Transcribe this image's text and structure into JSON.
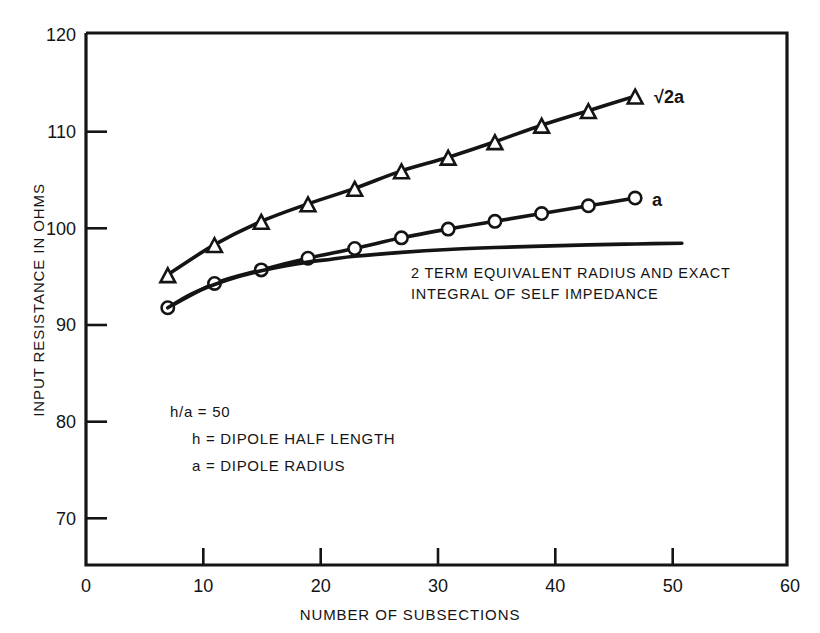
{
  "chart_data": {
    "type": "line",
    "title": "",
    "xlabel": "NUMBER OF SUBSECTIONS",
    "ylabel": "INPUT RESISTANCE IN OHMS",
    "xlim": [
      0,
      60
    ],
    "ylim": [
      65.2,
      120
    ],
    "grid": false,
    "legend_position": "inline-right-of-curve",
    "xticks": [
      0,
      10,
      20,
      30,
      40,
      50,
      60
    ],
    "xtick_labels": [
      "0",
      "10",
      "20",
      "30",
      "40",
      "50",
      "60"
    ],
    "yticks": [
      70,
      80,
      90,
      100,
      110,
      120
    ],
    "ytick_labels": [
      "70",
      "80",
      "90",
      "100",
      "110",
      "120"
    ],
    "series": [
      {
        "name": "sqrt2a",
        "label": "√2a",
        "marker": "triangle",
        "x": [
          7,
          11,
          15,
          19,
          23,
          27,
          31,
          35,
          39,
          43,
          47
        ],
        "values": [
          95.1,
          98.2,
          100.6,
          102.4,
          104.0,
          105.8,
          107.2,
          108.8,
          110.5,
          112.0,
          113.5
        ]
      },
      {
        "name": "a",
        "label": "a",
        "marker": "circle",
        "x": [
          7,
          11,
          15,
          19,
          23,
          27,
          31,
          35,
          39,
          43,
          47
        ],
        "values": [
          91.7,
          94.2,
          95.6,
          96.8,
          97.8,
          98.9,
          99.8,
          100.6,
          101.4,
          102.2,
          103.0
        ]
      },
      {
        "name": "two-term-equivalent-radius",
        "label": "",
        "marker": "none",
        "x": [
          7,
          9,
          11,
          13,
          15,
          17,
          19,
          21,
          23,
          27,
          31,
          35,
          39,
          43,
          47,
          51
        ],
        "values": [
          91.7,
          93.1,
          94.1,
          94.9,
          95.5,
          96.0,
          96.4,
          96.7,
          97.0,
          97.4,
          97.7,
          97.9,
          98.05,
          98.18,
          98.27,
          98.35
        ]
      }
    ],
    "annotations": [
      {
        "name": "curve-note",
        "lines": [
          "2 TERM EQUIVALENT RADIUS AND EXACT",
          "INTEGRAL OF SELF IMPEDANCE"
        ]
      },
      {
        "name": "parameters",
        "lines": [
          "h/a =  50",
          "h =  DIPOLE HALF LENGTH",
          "a =  DIPOLE RADIUS"
        ]
      }
    ]
  },
  "colors": {
    "ink": "#141414",
    "background": "#ffffff",
    "marker_fill": "#ffffff"
  }
}
